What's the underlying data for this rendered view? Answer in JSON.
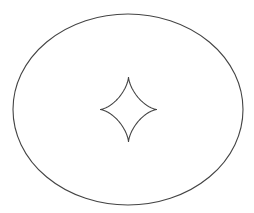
{
  "diagram": {
    "background": "#ffffff",
    "stroke_color": "#444444",
    "ellipse": {
      "cx": 128,
      "cy": 109.5,
      "rx": 115,
      "ry": 95.5,
      "stroke_width": 1.1
    },
    "astroid": {
      "cx": 128.5,
      "cy": 109.5,
      "ax": 28.5,
      "ay": 32.5,
      "stroke_width": 1.1
    }
  }
}
